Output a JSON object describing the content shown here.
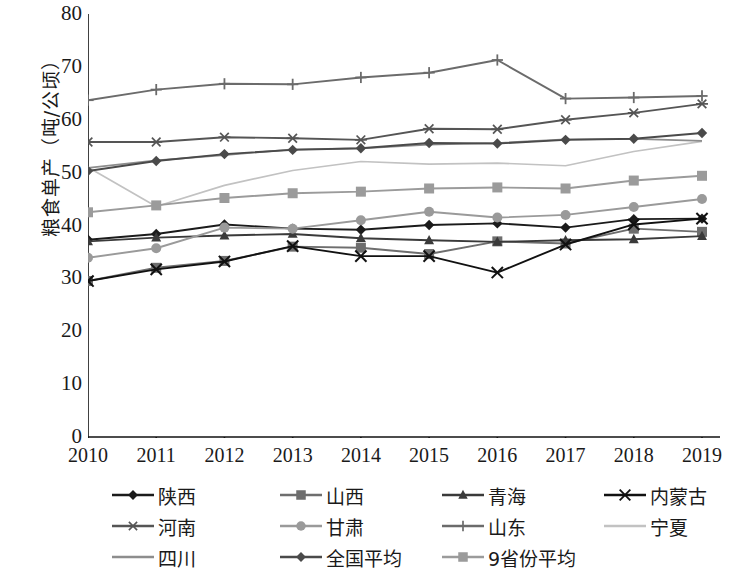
{
  "chart_data": {
    "type": "line",
    "title": "",
    "xlabel": "",
    "ylabel": "粮食单产（吨/公顷）",
    "x": [
      "2010",
      "2011",
      "2012",
      "2013",
      "2014",
      "2015",
      "2016",
      "2017",
      "2018",
      "2019"
    ],
    "xlim": [
      2010,
      2019
    ],
    "ylim": [
      0,
      80
    ],
    "yticks": [
      "0",
      "10",
      "20",
      "30",
      "40",
      "50",
      "60",
      "70",
      "80"
    ],
    "grid": false,
    "legend_position": "bottom",
    "series": [
      {
        "name": "陕西",
        "marker": "diamond",
        "color": "#1b1b1b",
        "values": [
          37.3,
          38.4,
          40.2,
          39.4,
          39.2,
          40.1,
          40.4,
          39.6,
          41.2,
          41.3
        ]
      },
      {
        "name": "山西",
        "marker": "square",
        "color": "#6e6e6e",
        "values": [
          29.5,
          32.0,
          33.3,
          36.0,
          35.8,
          34.6,
          37.0,
          36.6,
          39.4,
          38.8
        ]
      },
      {
        "name": "青海",
        "marker": "triangle",
        "color": "#3a3a3a",
        "values": [
          37.0,
          37.7,
          38.1,
          38.4,
          37.6,
          37.2,
          36.9,
          37.2,
          37.4,
          38.0
        ]
      },
      {
        "name": "内蒙古",
        "marker": "x",
        "color": "#111111",
        "values": [
          29.5,
          31.7,
          33.2,
          36.1,
          34.2,
          34.2,
          31.1,
          36.4,
          40.2,
          41.3
        ]
      },
      {
        "name": "河南",
        "marker": "asterisk",
        "color": "#555555",
        "values": [
          55.8,
          55.8,
          56.7,
          56.5,
          56.2,
          58.3,
          58.2,
          60.0,
          61.3,
          63.0
        ]
      },
      {
        "name": "甘肃",
        "marker": "circle",
        "color": "#9a9a9a",
        "values": [
          33.9,
          35.7,
          39.6,
          39.4,
          41.0,
          42.6,
          41.5,
          42.0,
          43.5,
          45.0
        ]
      },
      {
        "name": "山东",
        "marker": "plus",
        "color": "#6b6b6b",
        "values": [
          63.7,
          65.7,
          66.8,
          66.7,
          68.0,
          68.9,
          71.3,
          64.0,
          64.2,
          64.5
        ]
      },
      {
        "name": "宁夏",
        "marker": "none",
        "color": "#c2c2c2",
        "values": [
          51.0,
          43.6,
          47.6,
          50.4,
          52.1,
          51.6,
          51.8,
          51.3,
          54.0,
          55.9
        ]
      },
      {
        "name": "四川",
        "marker": "none",
        "color": "#8d8d8d",
        "values": [
          50.9,
          52.3,
          53.3,
          54.4,
          54.6,
          55.3,
          55.6,
          56.3,
          56.4,
          56.0
        ]
      },
      {
        "name": "全国平均",
        "marker": "diamond",
        "color": "#4a4a4a",
        "values": [
          50.3,
          52.2,
          53.5,
          54.3,
          54.6,
          55.6,
          55.5,
          56.2,
          56.4,
          57.5
        ]
      },
      {
        "name": "9省份平均",
        "marker": "square",
        "color": "#9b9b9b",
        "values": [
          42.5,
          43.8,
          45.2,
          46.1,
          46.4,
          47.0,
          47.2,
          47.0,
          48.5,
          49.4
        ]
      }
    ]
  },
  "legend": {
    "items": [
      {
        "label": "陕西"
      },
      {
        "label": "山西"
      },
      {
        "label": "青海"
      },
      {
        "label": "内蒙古"
      },
      {
        "label": "河南"
      },
      {
        "label": "甘肃"
      },
      {
        "label": "山东"
      },
      {
        "label": "宁夏"
      },
      {
        "label": "四川"
      },
      {
        "label": "全国平均"
      },
      {
        "label": "9省份平均"
      }
    ]
  },
  "axis": {
    "y_title": "粮食单产（吨/公顷）"
  }
}
